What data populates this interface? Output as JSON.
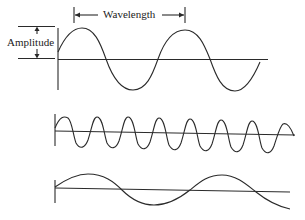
{
  "diagram": {
    "labels": {
      "wavelength": "Wavelength",
      "amplitude": "Amplitude"
    },
    "colors": {
      "stroke": "#2a2a2a",
      "background": "#ffffff"
    },
    "waves": [
      {
        "name": "reference-wave",
        "amplitude": "medium",
        "cycles": 2.0,
        "description": "baseline wave with labeled wavelength and amplitude"
      },
      {
        "name": "high-frequency-wave",
        "amplitude": "small",
        "cycles": 7.0,
        "description": "shorter wavelength, higher frequency"
      },
      {
        "name": "low-frequency-wave",
        "amplitude": "small",
        "cycles": 1.3,
        "description": "longer wavelength, lower frequency"
      }
    ]
  }
}
